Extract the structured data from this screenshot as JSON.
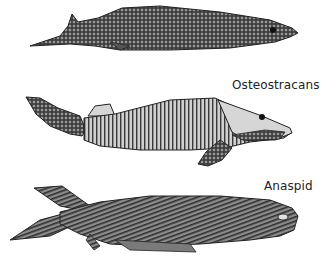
{
  "figure": {
    "labels": {
      "osteostracans": "Osteostracans",
      "anaspid": "Anaspid"
    },
    "specimens": [
      {
        "id": "top-fish",
        "description": "armored jawless fish with scale mesh pattern",
        "caption": ""
      },
      {
        "id": "middle-fish",
        "description": "osteostracan with head shield and segmented body",
        "caption": "Osteostracans"
      },
      {
        "id": "bottom-fish",
        "description": "anaspid with striated scales",
        "caption": "Anaspid"
      }
    ],
    "colors": {
      "ink": "#2a2a2a",
      "light_fill": "#d6d6d6",
      "mid_fill": "#8a8a8a"
    }
  }
}
